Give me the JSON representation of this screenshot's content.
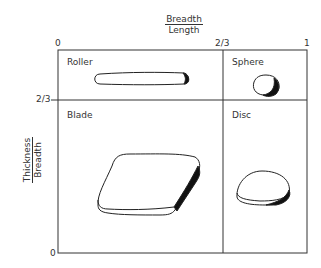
{
  "x_axis": {
    "label_numerator": "Breadth",
    "label_denominator": "Length",
    "ticks": [
      "0",
      "2/3",
      "1"
    ]
  },
  "y_axis": {
    "label_numerator": "Thickness",
    "label_denominator": "Breadth",
    "ticks": [
      "2/3",
      "0"
    ]
  },
  "quadrants": [
    {
      "label": "Roller"
    },
    {
      "label": "Sphere"
    },
    {
      "label": "Blade"
    },
    {
      "label": "Disc"
    }
  ]
}
